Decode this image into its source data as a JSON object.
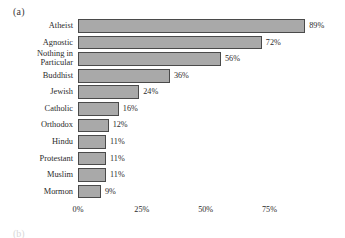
{
  "panel": {
    "letter": "(a)",
    "next_letter_partial": "(b)"
  },
  "colors": {
    "bar_fill": "#a9a9a9",
    "bar_stroke": "#4a4a4a",
    "text": "#2b2b2b",
    "background": "#ffffff"
  },
  "chart_data": {
    "type": "bar",
    "orientation": "horizontal",
    "title": "",
    "subtitle": "",
    "xlabel": "",
    "ylabel": "",
    "grid": false,
    "legend": null,
    "xlim": [
      0,
      89
    ],
    "axis_unit": "%",
    "xticks": [
      {
        "value": 0,
        "label": "0%"
      },
      {
        "value": 25,
        "label": "25%"
      },
      {
        "value": 50,
        "label": "50%"
      },
      {
        "value": 75,
        "label": "75%"
      }
    ],
    "categories": [
      "Atheist",
      "Agnostic",
      "Nothing in\nParticular",
      "Buddhist",
      "Jewish",
      "Catholic",
      "Orthodox",
      "Hindu",
      "Protestant",
      "Muslim",
      "Mormon"
    ],
    "values": [
      89,
      72,
      56,
      36,
      24,
      16,
      12,
      11,
      11,
      11,
      9
    ],
    "data_labels": [
      "89%",
      "72%",
      "56%",
      "36%",
      "24%",
      "16%",
      "12%",
      "11%",
      "11%",
      "11%",
      "9%"
    ],
    "bars": [
      {
        "category": "Atheist",
        "value": 89,
        "label": "89%",
        "two_line": false
      },
      {
        "category": "Agnostic",
        "value": 72,
        "label": "72%",
        "two_line": false
      },
      {
        "category": "Nothing in\nParticular",
        "value": 56,
        "label": "56%",
        "two_line": true
      },
      {
        "category": "Buddhist",
        "value": 36,
        "label": "36%",
        "two_line": false
      },
      {
        "category": "Jewish",
        "value": 24,
        "label": "24%",
        "two_line": false
      },
      {
        "category": "Catholic",
        "value": 16,
        "label": "16%",
        "two_line": false
      },
      {
        "category": "Orthodox",
        "value": 12,
        "label": "12%",
        "two_line": false
      },
      {
        "category": "Hindu",
        "value": 11,
        "label": "11%",
        "two_line": false
      },
      {
        "category": "Protestant",
        "value": 11,
        "label": "11%",
        "two_line": false
      },
      {
        "category": "Muslim",
        "value": 11,
        "label": "11%",
        "two_line": false
      },
      {
        "category": "Mormon",
        "value": 9,
        "label": "9%",
        "two_line": false
      }
    ]
  }
}
